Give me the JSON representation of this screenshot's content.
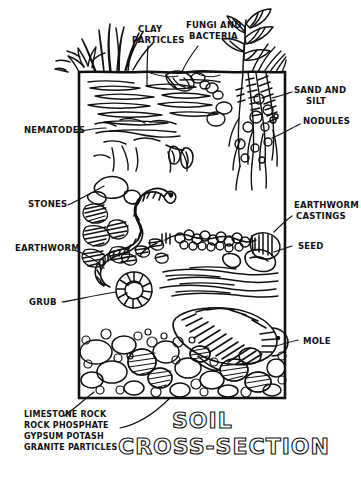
{
  "figure": {
    "title_line1": "SOIL",
    "title_line2": "CROSS-SECTION",
    "style": "hand-drawn pen and ink illustration",
    "ink_color": "#111111",
    "paper_color": "#ffffff"
  },
  "labels": {
    "clay_particles": "CLAY\nPARTICLES",
    "clay_particles_l1": "CLAY",
    "clay_particles_l2": "PARTICLES",
    "fungi_bacteria_l1": "FUNGI AND",
    "fungi_bacteria_l2": "BACTERIA",
    "sand_silt_l1": "SAND AND",
    "sand_silt_l2": "SILT",
    "nodules": "NODULES",
    "nematodes": "NEMATODES",
    "stones": "STONES",
    "earthworm": "EARTHWORM",
    "earthworm_castings_l1": "EARTHWORM",
    "earthworm_castings_l2": "CASTINGS",
    "seed": "SEED",
    "grub": "GRUB",
    "mole": "MOLE",
    "minerals_l1": "LIMESTONE ROCK",
    "minerals_l2": "ROCK PHOSPHATE",
    "minerals_l3": "GYPSUM POTASH",
    "minerals_l4": "GRANITE PARTICLES"
  },
  "elements": {
    "grass_tuft": "grass-tuft",
    "plant": "leafy-plant",
    "soil_surface": "soil-surface-line",
    "frame": "soil-profile-frame",
    "clay_layer": "clay-particle-layer",
    "root_mass": "root-mass",
    "nematode_worms": "nematode-worms",
    "stone_cluster": "stone-cluster",
    "earthworm_body": "earthworm-body",
    "casting_chain": "earthworm-casting-chain",
    "seed_shape": "seed-shape",
    "grub_spiral": "grub-spiral",
    "mole_body": "mole-body",
    "rock_bed": "rock-bed"
  }
}
